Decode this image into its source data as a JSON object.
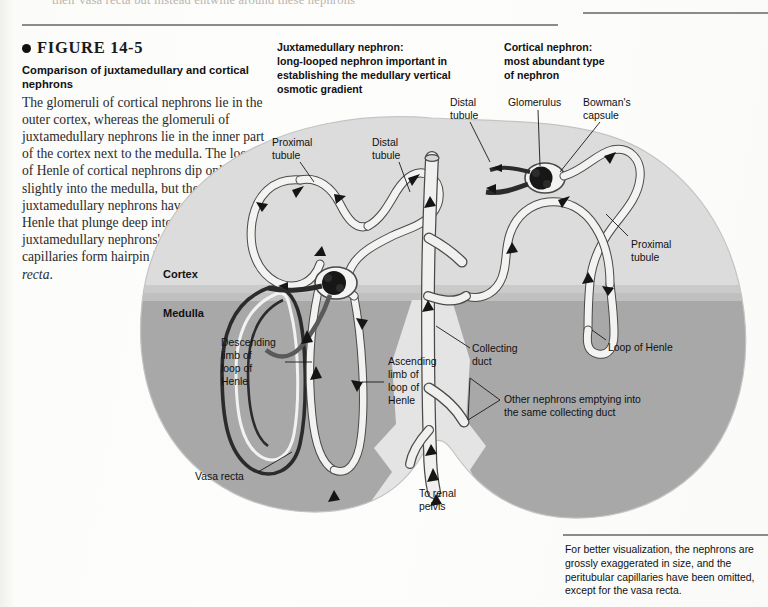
{
  "page": {
    "bleed_text_top": "their vasa recta but instead entwine around these nephrons"
  },
  "caption": {
    "figure_number": "FIGURE 14-5",
    "title": "Comparison of juxtamedullary and cortical nephrons",
    "body": "The glomeruli of cortical nephrons lie in the outer cortex, whereas the glomeruli of juxtamedullary nephrons lie in the inner part of the cortex next to the medulla. The loops of Henle of cortical nephrons dip only slightly into the medulla, but the juxtamedullary nephrons have long loops of Henle that plunge deep into the medulla. The juxtamedullary nephrons' peritubular capillaries form hairpin loops known as ",
    "body_italic_tail": "vasa recta",
    "body_end": "."
  },
  "headers": {
    "juxtamedullary": "Juxtamedullary nephron:\nlong-looped nephron important in\nestablishing the medullary vertical\nosmotic gradient",
    "cortical": "Cortical nephron:\nmost abundant type\nof nephron"
  },
  "labels": {
    "distal_tubule_1": "Distal\ntubule",
    "glomerulus": "Glomerulus",
    "bowmans_capsule": "Bowman's\ncapsule",
    "proximal_tubule_1": "Proximal\ntubule",
    "distal_tubule_2": "Distal\ntubule",
    "proximal_tubule_2": "Proximal\ntubule",
    "cortex": "Cortex",
    "medulla": "Medulla",
    "descending_limb": "Descending\nlimb of\nloop of\nHenle",
    "ascending_limb": "Ascending\nlimb of\nloop of\nHenle",
    "collecting_duct": "Collecting\nduct",
    "loop_of_henle": "Loop of Henle",
    "other_nephrons": "Other nephrons emptying into\nthe same collecting duct",
    "vasa_recta": "Vasa recta",
    "to_renal_pelvis": "To renal\npelvis"
  },
  "note": {
    "text": "For better visualization, the nephrons are grossly exaggerated in size, and the peritubular capillaries have been omitted, except for the vasa recta."
  },
  "colors": {
    "cortex_fill": "#dcdcdc",
    "medulla_fill": "#a8a8a8",
    "pelvis_fill": "#e4e4e4",
    "tubule_fill": "#f4f4f2",
    "tubule_stroke": "#4a4a4a",
    "vessel_dark": "#2b2b2b",
    "text": "#111111",
    "rule": "#8b8b8b",
    "page_bg": "#fdfdfb"
  }
}
